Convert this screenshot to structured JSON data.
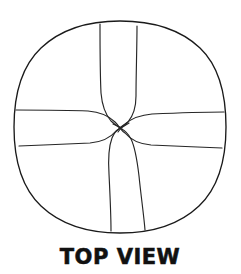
{
  "figure": {
    "name": "top-view-sketch",
    "style": "hand-drawn line art",
    "caption": "TOP VIEW",
    "background_color": "#ffffff",
    "ink_color": "#1a1a1a"
  },
  "outline": {
    "label": "circle-outline",
    "shape": "circle",
    "center_x": 120,
    "center_y": 127,
    "radius_x": 106,
    "radius_y": 106,
    "bounds": {
      "left": 14,
      "top": 21,
      "right": 226,
      "bottom": 233
    }
  },
  "seams": {
    "count": 8,
    "junction": {
      "x": 120,
      "y": 128
    },
    "bands": [
      {
        "label": "top-band-left-edge",
        "orientation": "vertical",
        "rim_x": 100,
        "rim_y": 24
      },
      {
        "label": "top-band-right-edge",
        "orientation": "vertical",
        "rim_x": 137,
        "rim_y": 26
      },
      {
        "label": "bottom-band-left-edge",
        "orientation": "vertical",
        "rim_x": 111,
        "rim_y": 231
      },
      {
        "label": "bottom-band-right-edge",
        "orientation": "vertical",
        "rim_x": 145,
        "rim_y": 230
      },
      {
        "label": "left-band-top-edge",
        "orientation": "horizontal",
        "rim_x": 16,
        "rim_y": 110
      },
      {
        "label": "left-band-bottom-edge",
        "orientation": "horizontal",
        "rim_x": 19,
        "rim_y": 146
      },
      {
        "label": "right-band-top-edge",
        "orientation": "horizontal",
        "rim_x": 224,
        "rim_y": 112
      },
      {
        "label": "right-band-bottom-edge",
        "orientation": "horizontal",
        "rim_x": 222,
        "rim_y": 148
      }
    ]
  },
  "caption": {
    "label": "caption-top-view",
    "text": "TOP VIEW",
    "x": 120,
    "y": 264,
    "align": "center"
  }
}
